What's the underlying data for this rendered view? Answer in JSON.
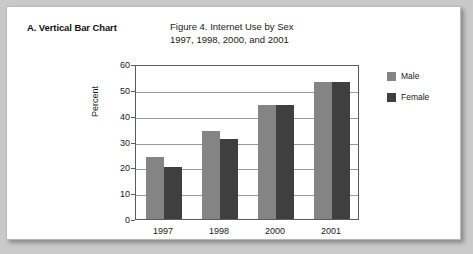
{
  "panel": {
    "label": "A. Vertical Bar Chart"
  },
  "legend": {
    "position": "right",
    "entries": [
      {
        "name": "Male",
        "color": "#848484"
      },
      {
        "name": "Female",
        "color": "#3f3f3f"
      }
    ]
  },
  "chart_data": {
    "type": "bar",
    "title": "Figure 4. Internet Use by Sex",
    "subtitle": "1997, 1998, 2000, and 2001",
    "xlabel": "",
    "ylabel": "Percent",
    "categories": [
      "1997",
      "1998",
      "2000",
      "2001"
    ],
    "series": [
      {
        "name": "Male",
        "color": "#848484",
        "values": [
          24,
          34,
          44,
          53
        ]
      },
      {
        "name": "Female",
        "color": "#3f3f3f",
        "values": [
          20,
          31,
          44,
          53
        ]
      }
    ],
    "ylim": [
      0,
      60
    ],
    "yticks": [
      0,
      10,
      20,
      30,
      40,
      50,
      60
    ],
    "ytick_labels": [
      "0",
      "10",
      "20",
      "30",
      "40",
      "50",
      "60"
    ],
    "grid": "horizontal",
    "legend_position": "right"
  }
}
